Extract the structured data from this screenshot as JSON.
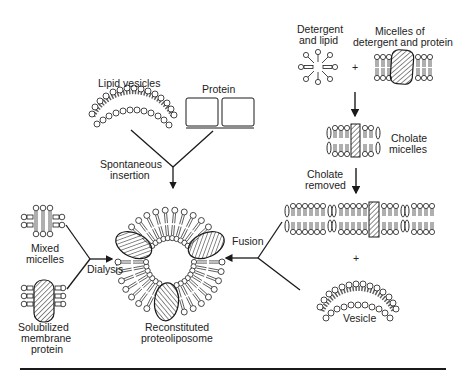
{
  "diagram": {
    "labels": {
      "lipid_vesicles": "Lipid vesicles",
      "protein": "Protein",
      "spontaneous_1": "Spontaneous",
      "spontaneous_2": "insertion",
      "detergent_1": "Detergent",
      "detergent_2": "and lipid",
      "micelles_dp_1": "Micelles of",
      "micelles_dp_2": "detergent and protein",
      "plus_top": "+",
      "cholate_1": "Cholate",
      "cholate_2": "micelles",
      "cholate_removed_1": "Cholate",
      "cholate_removed_2": "removed",
      "plus_mid": "+",
      "fusion": "Fusion",
      "vesicle": "Vesicle",
      "mixed_1": "Mixed",
      "mixed_2": "micelles",
      "dialysis": "Dialysis",
      "solub_1": "Solubilized",
      "solub_2": "membrane",
      "solub_3": "protein",
      "recon_1": "Reconstituted",
      "recon_2": "proteoliposome"
    },
    "pathways": [
      {
        "name": "Spontaneous insertion",
        "inputs": [
          "Lipid vesicles",
          "Protein"
        ],
        "output": "Reconstituted proteoliposome"
      },
      {
        "name": "Dialysis",
        "inputs": [
          "Mixed micelles",
          "Solubilized membrane protein"
        ],
        "output": "Reconstituted proteoliposome"
      },
      {
        "name": "Fusion",
        "inputs": [
          "Detergent and lipid",
          "Micelles of detergent and protein",
          "Cholate micelles",
          "Cholate removed",
          "Vesicle"
        ],
        "output": "Reconstituted proteoliposome"
      }
    ],
    "colors": {
      "ink": "#1a1a1a",
      "background": "#ffffff"
    }
  }
}
